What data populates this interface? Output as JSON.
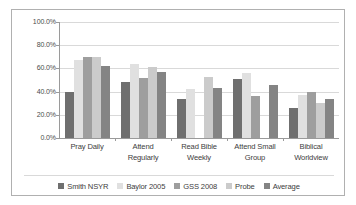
{
  "chart_data": {
    "type": "bar",
    "title": "",
    "xlabel": "",
    "ylabel": "",
    "ylim": [
      0,
      100
    ],
    "ytick_labels": [
      "100.0%",
      "80.0%",
      "60.0%",
      "40.0%",
      "20.0%",
      "0.0%"
    ],
    "ytick_values": [
      100,
      80,
      60,
      40,
      20,
      0
    ],
    "grid": true,
    "legend_position": "bottom",
    "categories": [
      "Pray Daily",
      "Attend Regularly",
      "Read Bible Weekly",
      "Attend Small Group",
      "Biblical Worldview"
    ],
    "category_lines": [
      [
        "Pray Daily"
      ],
      [
        "Attend",
        "Regularly"
      ],
      [
        "Read Bible",
        "Weekly"
      ],
      [
        "Attend Small",
        "Group"
      ],
      [
        "Biblical",
        "Worldview"
      ]
    ],
    "series": [
      {
        "name": "Smith NSYR",
        "color": "#6f6f6f",
        "values": [
          39.5,
          48.5,
          34.0,
          51.0,
          26.0
        ]
      },
      {
        "name": "Baylor 2005",
        "color": "#e0e0e0",
        "values": [
          67.0,
          64.0,
          42.5,
          56.0,
          37.0
        ]
      },
      {
        "name": "GSS 2008",
        "color": "#9e9e9e",
        "values": [
          69.5,
          52.0,
          null,
          36.0,
          40.0
        ]
      },
      {
        "name": "Probe",
        "color": "#cbcbcb",
        "values": [
          69.5,
          61.5,
          52.5,
          null,
          30.0
        ]
      },
      {
        "name": "Average",
        "color": "#848484",
        "values": [
          62.0,
          56.5,
          43.0,
          45.5,
          33.5
        ]
      }
    ]
  },
  "legend": {
    "items": [
      {
        "label": "Smith NSYR"
      },
      {
        "label": "Baylor 2005"
      },
      {
        "label": "GSS 2008"
      },
      {
        "label": "Probe"
      },
      {
        "label": "Average"
      }
    ]
  }
}
